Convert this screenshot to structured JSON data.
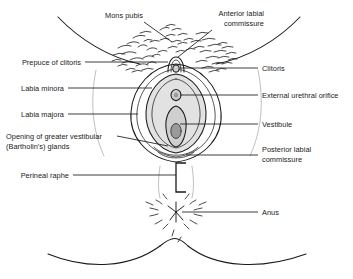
{
  "figure": {
    "colors": {
      "ink": "#1a1a1a",
      "leader": "#1a1a1a",
      "background": "#ffffff",
      "shade_light": "#e2e2e2",
      "shade_mid": "#cfcfcf",
      "shade_dark": "#9a9a9a",
      "faint_outline": "#b4b4b4"
    }
  },
  "labels": {
    "mons_pubis": "Mons pubis",
    "anterior_labial_commissure_line1": "Anterior labial",
    "anterior_labial_commissure_line2": "commissure",
    "prepuce_of_clitoris": "Prepuce of clitoris",
    "labia_minora": "Labia minora",
    "labia_majora": "Labia majora",
    "bartholin_line1": "Opening of greater vestibular",
    "bartholin_line2": "(Bartholin's) glands",
    "perineal_raphe": "Perineal raphe",
    "clitoris": "Clitoris",
    "external_urethral_orifice": "External urethral orifice",
    "vestibule": "Vestibule",
    "posterior_labial_commissure_line1": "Posterior labial",
    "posterior_labial_commissure_line2": "commissure",
    "anus": "Anus"
  }
}
